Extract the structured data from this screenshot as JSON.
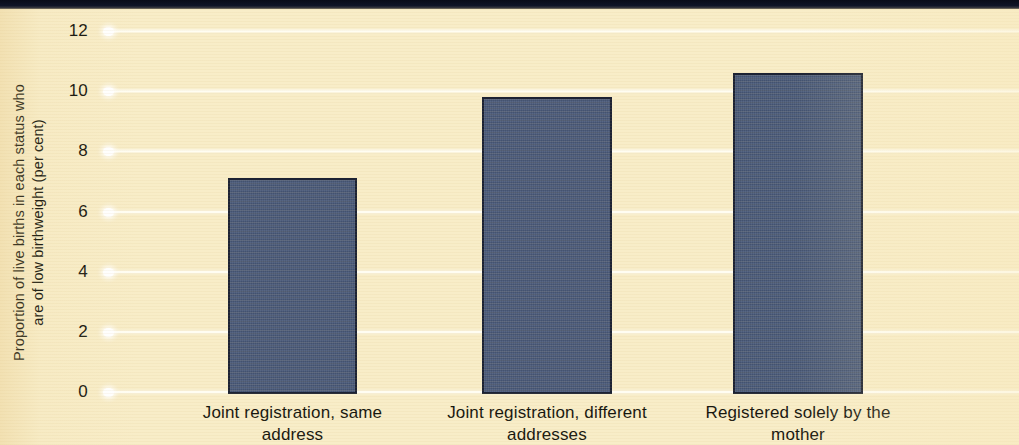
{
  "chart_data": {
    "type": "bar",
    "title": "",
    "subtitle": "",
    "xlabel": "",
    "ylabel": "Proportion of live births in each status who\nare of low birthweight (per cent)",
    "categories": [
      "Joint registration, same\naddress",
      "Joint registration, different\naddresses",
      "Registered solely by the\nmother"
    ],
    "values": [
      7.1,
      9.8,
      10.6
    ],
    "ylim": [
      0,
      12
    ],
    "ytick_values": [
      0,
      2,
      4,
      6,
      8,
      10,
      12
    ],
    "ytick_labels": [
      "0",
      "2",
      "4",
      "6",
      "8",
      "10",
      "12"
    ],
    "grid": true,
    "grid_orientation": "horizontal",
    "legend": false,
    "legend_position": "none",
    "series": [
      {
        "name": "Low birthweight proportion",
        "values": [
          7.1,
          9.8,
          10.6
        ]
      }
    ]
  },
  "style": {
    "background_color": "#f8edc8",
    "bar_color": "#4a5a7a",
    "bar_edge_color": "#1c2233",
    "gridline_color": "#fffdf2",
    "text_color": "#16160f",
    "top_strip_color": "#0f1426"
  }
}
